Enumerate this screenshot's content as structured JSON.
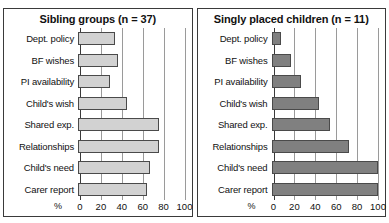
{
  "figure": {
    "axis_unit_label": "%",
    "categories": [
      "Dept. policy",
      "BF wishes",
      "PI availability",
      "Child's wish",
      "Shared exp.",
      "Relationships",
      "Child's need",
      "Carer report"
    ],
    "ticks": [
      "0",
      "20",
      "40",
      "60",
      "80",
      "100"
    ],
    "xlim": [
      0,
      100
    ]
  },
  "chart_data": [
    {
      "type": "bar",
      "title": "Sibling groups (n = 37)",
      "orientation": "horizontal",
      "categories": [
        "Dept. policy",
        "BF wishes",
        "PI availability",
        "Child's wish",
        "Shared exp.",
        "Relationships",
        "Child's need",
        "Carer report"
      ],
      "values": [
        35,
        38,
        30,
        46,
        76,
        76,
        68,
        65
      ],
      "xlabel": "%",
      "ylabel": "",
      "xlim": [
        0,
        100
      ],
      "xticks": [
        0,
        20,
        40,
        60,
        80,
        100
      ],
      "grid": true,
      "legend": "none",
      "bar_fill": "#d2d2d2",
      "bar_stroke": "#4a4a4a"
    },
    {
      "type": "bar",
      "title": "Singly placed children (n = 11)",
      "orientation": "horizontal",
      "categories": [
        "Dept. policy",
        "BF wishes",
        "PI availability",
        "Child's wish",
        "Shared exp.",
        "Relationships",
        "Child's need",
        "Carer report"
      ],
      "values": [
        9,
        18,
        28,
        45,
        55,
        73,
        100,
        100
      ],
      "xlabel": "%",
      "ylabel": "",
      "xlim": [
        0,
        100
      ],
      "xticks": [
        0,
        20,
        40,
        60,
        80,
        100
      ],
      "grid": true,
      "legend": "none",
      "bar_fill": "#808080",
      "bar_stroke": "#4a4a4a"
    }
  ]
}
